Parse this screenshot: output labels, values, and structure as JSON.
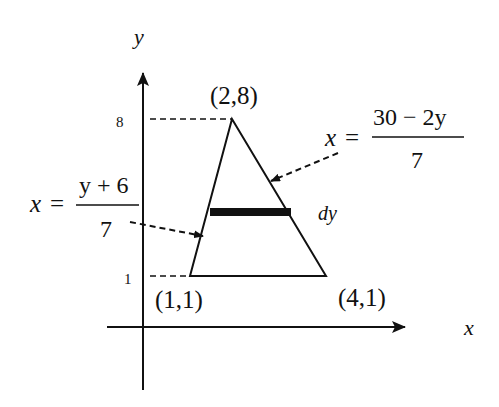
{
  "diagram": {
    "type": "region-integration-figure",
    "axes": {
      "x_label": "x",
      "y_label": "y",
      "y_ticks": [
        {
          "value": 8,
          "label": "8"
        },
        {
          "value": 1,
          "label": "1"
        }
      ]
    },
    "vertices": [
      {
        "label": "(2,8)",
        "x": 2,
        "y": 8
      },
      {
        "label": "(1,1)",
        "x": 1,
        "y": 1
      },
      {
        "label": "(4,1)",
        "x": 4,
        "y": 1
      }
    ],
    "strip": {
      "label": "dy",
      "orientation": "horizontal"
    },
    "left_boundary": {
      "lhs": "x",
      "eq": "=",
      "numerator": "y + 6",
      "denominator": "7"
    },
    "right_boundary": {
      "lhs": "x",
      "eq": "=",
      "numerator": "30 − 2y",
      "denominator": "7"
    },
    "colors": {
      "stroke": "#111111",
      "background": "#ffffff"
    }
  }
}
